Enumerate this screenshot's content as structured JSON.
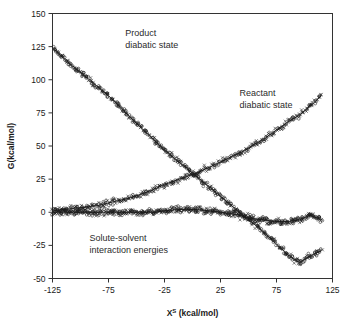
{
  "chart_data": {
    "type": "scatter",
    "title": "",
    "xlabel": "X^S (kcal/mol)",
    "xlabel_base": "X",
    "xlabel_sup": "S",
    "xlabel_unit": " (kcal/mol)",
    "ylabel": "G(kcal/mol)",
    "xlim": [
      -125,
      125
    ],
    "ylim": [
      -50,
      150
    ],
    "xticks": [
      -125,
      -75,
      -25,
      25,
      75,
      125
    ],
    "xtick_labels": [
      "-125",
      "-75",
      "-25",
      "25",
      "75",
      "125"
    ],
    "yticks": [
      -50,
      -25,
      0,
      25,
      50,
      75,
      100,
      125,
      150
    ],
    "ytick_labels": [
      "-50",
      "-25",
      "0",
      "25",
      "50",
      "75",
      "100",
      "125",
      "150"
    ],
    "grid": false,
    "legend": "none",
    "marker_types": [
      "open-circle",
      "cross"
    ],
    "annotations": [
      {
        "text_line1": "Product",
        "text_line2": "diabatic state",
        "x": -60,
        "y": 133
      },
      {
        "text_line1": "Reactant",
        "text_line2": "diabatic state",
        "x": 42,
        "y": 88
      },
      {
        "text_line1": "Solute-solvent",
        "text_line2": "interaction energies",
        "x": -92,
        "y": -22
      }
    ],
    "series": [
      {
        "name": "Product diabatic state",
        "marker": "open-circle",
        "fit_line": true,
        "x": [
          -125,
          -115,
          -105,
          -95,
          -85,
          -75,
          -65,
          -55,
          -45,
          -35,
          -25,
          -15,
          -5,
          5,
          15,
          25,
          35,
          45,
          55,
          65,
          75,
          85,
          95,
          105,
          115
        ],
        "values": [
          124,
          116,
          109,
          102,
          95,
          88,
          80,
          71,
          63,
          55,
          47,
          40,
          33,
          26,
          19,
          12,
          5,
          -2,
          -9,
          -16,
          -24,
          -32,
          -38,
          -33,
          -29
        ]
      },
      {
        "name": "Reactant diabatic state",
        "marker": "cross",
        "fit_line": true,
        "x": [
          -125,
          -115,
          -105,
          -95,
          -85,
          -75,
          -65,
          -55,
          -45,
          -35,
          -25,
          -15,
          -5,
          5,
          15,
          25,
          35,
          45,
          55,
          65,
          75,
          85,
          95,
          105,
          115
        ],
        "values": [
          1,
          2,
          3,
          4,
          5,
          7,
          9,
          11,
          14,
          17,
          21,
          24,
          27,
          30,
          34,
          38,
          42,
          46,
          51,
          56,
          62,
          68,
          73,
          80,
          88
        ]
      },
      {
        "name": "Solute-solvent interaction energies",
        "marker": "open-circle",
        "fit_line": true,
        "x": [
          -125,
          -115,
          -105,
          -95,
          -85,
          -75,
          -65,
          -55,
          -45,
          -35,
          -25,
          -15,
          -5,
          5,
          15,
          25,
          35,
          45,
          55,
          65,
          75,
          85,
          95,
          105,
          115
        ],
        "values": [
          0,
          0,
          0,
          0,
          0,
          0,
          0,
          0,
          0,
          0,
          1,
          2,
          2,
          2,
          1,
          0,
          -1,
          -3,
          -5,
          -6,
          -7,
          -7,
          -6,
          -2,
          -6
        ]
      }
    ]
  }
}
